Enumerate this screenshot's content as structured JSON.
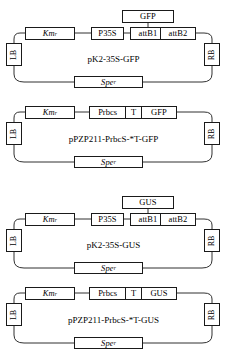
{
  "figure": {
    "type": "plasmid-construct-diagram",
    "count": 4,
    "line_color": "#1a1a1a",
    "background": "#ffffff"
  },
  "constructs": [
    {
      "id": "pk2-35s-gfp",
      "name": "pK2-35S-GFP",
      "left_border": "LB",
      "right_border": "RB",
      "selection_marker": {
        "gene": "Km",
        "superscript": "r"
      },
      "backbone_marker": {
        "gene": "Spe",
        "superscript": "r"
      },
      "elements": [
        {
          "key": "promoter",
          "label": "P35S"
        },
        {
          "key": "attb1",
          "label": "attB1"
        },
        {
          "key": "attb2",
          "label": "attB2"
        }
      ],
      "insert": {
        "label": "GFP",
        "position": "above-between-attb1-attb2"
      }
    },
    {
      "id": "ppzp211-prbcs-t-gfp",
      "name": "pPZP211-PrbcS-*T-GFP",
      "left_border": "LB",
      "right_border": "RB",
      "selection_marker": {
        "gene": "Km",
        "superscript": "r"
      },
      "backbone_marker": {
        "gene": "Spe",
        "superscript": "r"
      },
      "cassette": [
        {
          "key": "promoter",
          "label": "Prbcs"
        },
        {
          "key": "transit-peptide",
          "label": "T"
        },
        {
          "key": "reporter",
          "label": "GFP"
        }
      ]
    },
    {
      "id": "pk2-35s-gus",
      "name": "pK2-35S-GUS",
      "left_border": "LB",
      "right_border": "RB",
      "selection_marker": {
        "gene": "Km",
        "superscript": "r"
      },
      "backbone_marker": {
        "gene": "Spe",
        "superscript": "r"
      },
      "elements": [
        {
          "key": "promoter",
          "label": "P35S"
        },
        {
          "key": "attb1",
          "label": "attB1"
        },
        {
          "key": "attb2",
          "label": "attB2"
        }
      ],
      "insert": {
        "label": "GUS",
        "position": "above-between-attb1-attb2"
      }
    },
    {
      "id": "ppzp211-prbcs-t-gus",
      "name": "pPZP211-PrbcS-*T-GUS",
      "left_border": "LB",
      "right_border": "RB",
      "selection_marker": {
        "gene": "Km",
        "superscript": "r"
      },
      "backbone_marker": {
        "gene": "Spe",
        "superscript": "r"
      },
      "cassette": [
        {
          "key": "promoter",
          "label": "Prbcs"
        },
        {
          "key": "transit-peptide",
          "label": "T"
        },
        {
          "key": "reporter",
          "label": "GUS"
        }
      ]
    }
  ]
}
